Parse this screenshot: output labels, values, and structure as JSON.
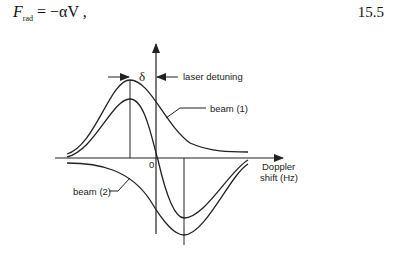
{
  "equation": {
    "lhs_symbol": "F",
    "lhs_subscript": "rad",
    "rhs": "= −αV ,",
    "number": "15.5"
  },
  "diagram": {
    "delta_label": "δ",
    "laser_detuning_label": "laser detuning",
    "beam1_label": "beam (1)",
    "beam2_label": "beam (2)",
    "origin_label": "0",
    "x_axis_label_line1": "Doppler",
    "x_axis_label_line2": "shift (Hz)"
  }
}
